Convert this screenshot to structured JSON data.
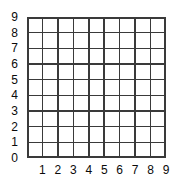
{
  "figure": {
    "kind": "blank-coordinate-grid",
    "background_color": "#ffffff",
    "line_color": "#3a3a3a",
    "text_color": "#0a0a0a"
  },
  "chart_data": {
    "type": "scatter",
    "title": "",
    "subtitle": "",
    "xlabel": "",
    "ylabel": "",
    "xlim": [
      0,
      9
    ],
    "ylim": [
      0,
      9
    ],
    "grid": true,
    "grid_columns": 9,
    "grid_rows": 9,
    "legend": null,
    "legend_position": "none",
    "annotations": [],
    "series": [
      {
        "name": "",
        "x": [],
        "y": []
      }
    ],
    "x_tick_labels": [
      "1",
      "2",
      "3",
      "4",
      "5",
      "6",
      "7",
      "8",
      "9"
    ],
    "x_tick_values": [
      1,
      2,
      3,
      4,
      5,
      6,
      7,
      8,
      9
    ],
    "y_tick_labels": [
      "0",
      "1",
      "2",
      "3",
      "4",
      "5",
      "6",
      "7",
      "8",
      "9"
    ],
    "y_tick_values": [
      0,
      1,
      2,
      3,
      4,
      5,
      6,
      7,
      8,
      9
    ]
  }
}
